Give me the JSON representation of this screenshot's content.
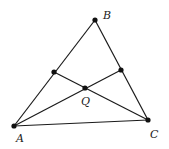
{
  "diagram": {
    "type": "triangle-cevians",
    "points": {
      "A": {
        "x": 14,
        "y": 126,
        "label": "A",
        "lx": 16,
        "ly": 142
      },
      "B": {
        "x": 95,
        "y": 20,
        "label": "B",
        "lx": 103,
        "ly": 19
      },
      "C": {
        "x": 148,
        "y": 120,
        "label": "C",
        "lx": 150,
        "ly": 138
      },
      "D": {
        "x": 54,
        "y": 72
      },
      "E": {
        "x": 121,
        "y": 70
      },
      "Q": {
        "x": 85,
        "y": 88,
        "label": "Q",
        "lx": 81,
        "ly": 105
      }
    },
    "segments": [
      [
        "A",
        "B"
      ],
      [
        "B",
        "C"
      ],
      [
        "A",
        "C"
      ],
      [
        "A",
        "E"
      ],
      [
        "C",
        "D"
      ]
    ],
    "labels": {
      "A": "A",
      "B": "B",
      "C": "C",
      "Q": "Q"
    }
  }
}
